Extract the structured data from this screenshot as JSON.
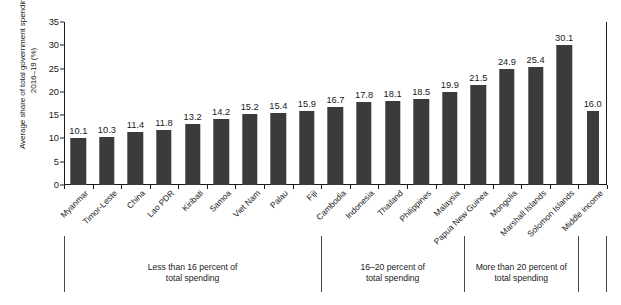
{
  "chart_data": {
    "type": "bar",
    "title": "",
    "xlabel": "",
    "ylabel": "Average share of total government spending, 2016–19 (%)",
    "ylim": [
      0,
      35
    ],
    "yticks": [
      0,
      5,
      10,
      15,
      20,
      25,
      30,
      35
    ],
    "grid": false,
    "legend": "none",
    "bar_color": "#3b3b3b",
    "categories": [
      "Myanmar",
      "Timor-Leste",
      "China",
      "Lao PDR",
      "Kiribati",
      "Samoa",
      "Viet Nam",
      "Palau",
      "Fiji",
      "Cambodia",
      "Indonesia",
      "Thailand",
      "Philippines",
      "Malaysia",
      "Papua New Guinea",
      "Mongolia",
      "Marshall Islands",
      "Solomon Islands",
      "Middle income"
    ],
    "values": [
      10.1,
      10.3,
      11.4,
      11.8,
      13.2,
      14.2,
      15.2,
      15.4,
      15.9,
      16.7,
      17.8,
      18.1,
      18.5,
      19.9,
      21.5,
      24.9,
      25.4,
      30.1,
      16.0
    ],
    "value_labels": [
      "10.1",
      "10.3",
      "11.4",
      "11.8",
      "13.2",
      "14.2",
      "15.2",
      "15.4",
      "15.9",
      "16.7",
      "17.8",
      "18.1",
      "18.5",
      "19.9",
      "21.5",
      "24.9",
      "25.4",
      "30.1",
      "16.0"
    ],
    "ytick_labels": [
      "0",
      "5",
      "10",
      "15",
      "20",
      "25",
      "30",
      "35"
    ],
    "groups": [
      {
        "caption_line1": "Less than 16 percent of",
        "caption_line2": "total spending",
        "start_index": 0,
        "end_index": 8
      },
      {
        "caption_line1": "16–20 percent of",
        "caption_line2": "total spending",
        "start_index": 9,
        "end_index": 13
      },
      {
        "caption_line1": "More than 20 percent of",
        "caption_line2": "total spending",
        "start_index": 14,
        "end_index": 17
      },
      {
        "caption_line1": "",
        "caption_line2": "",
        "start_index": 18,
        "end_index": 18
      }
    ]
  }
}
